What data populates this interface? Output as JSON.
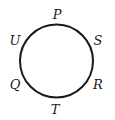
{
  "diagram": {
    "type": "circle-with-labeled-points",
    "labels": {
      "top": "P",
      "upper_right": "S",
      "lower_right": "R",
      "bottom": "T",
      "lower_left": "Q",
      "upper_left": "U"
    },
    "order_clockwise_from_top": [
      "P",
      "S",
      "R",
      "T",
      "Q",
      "U"
    ],
    "stroke_color": "#1a1a1a"
  }
}
